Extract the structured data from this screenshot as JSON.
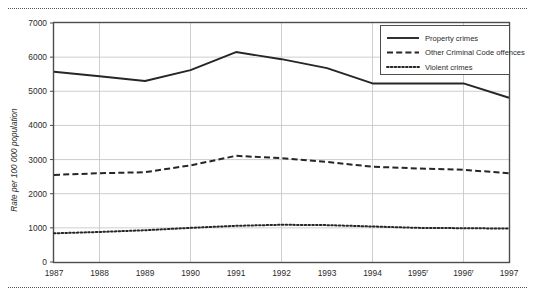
{
  "chart_data": {
    "type": "line",
    "title": "",
    "xlabel": "",
    "ylabel": "Rate per 100 000 population",
    "categories": [
      "1987",
      "1988",
      "1989",
      "1990",
      "1991",
      "1992",
      "1993",
      "1994",
      "1995",
      "1996",
      "1997"
    ],
    "tick_footnotes": [
      "",
      "",
      "",
      "",
      "",
      "",
      "",
      "",
      "r",
      "r",
      ""
    ],
    "x": [
      1987,
      1988,
      1989,
      1990,
      1991,
      1992,
      1993,
      1994,
      1995,
      1996,
      1997
    ],
    "ylim": [
      0,
      7000
    ],
    "yticks": [
      0,
      1000,
      2000,
      3000,
      4000,
      5000,
      6000,
      7000
    ],
    "ytick_labels": [
      "0",
      "1000",
      "2000",
      "3000",
      "4000",
      "5000",
      "6000",
      "7000"
    ],
    "grid": "horizontal-and-vertical",
    "vertical_gridline_years": [
      1988,
      1990,
      1992,
      1994,
      1996
    ],
    "legend_position": "top-right",
    "series": [
      {
        "name": "Property crimes",
        "style": "solid",
        "color": "#262626",
        "values": [
          5570,
          5440,
          5300,
          5620,
          6150,
          5940,
          5680,
          5230,
          5230,
          5230,
          4810
        ]
      },
      {
        "name": "Other Criminal Code offences",
        "style": "dashed",
        "color": "#262626",
        "values": [
          2550,
          2600,
          2630,
          2830,
          3110,
          3040,
          2930,
          2790,
          2740,
          2700,
          2600
        ]
      },
      {
        "name": "Violent crimes",
        "style": "dotted",
        "color": "#262626",
        "values": [
          840,
          880,
          930,
          1000,
          1060,
          1090,
          1080,
          1040,
          1000,
          990,
          980
        ]
      }
    ]
  },
  "legend": {
    "items": [
      {
        "label": "Property crimes",
        "style": "solid"
      },
      {
        "label": "Other Criminal Code offences",
        "style": "dashed"
      },
      {
        "label": "Violent crimes",
        "style": "dotted"
      }
    ]
  },
  "axes": {
    "y_title": "Rate per 100 000 population"
  }
}
